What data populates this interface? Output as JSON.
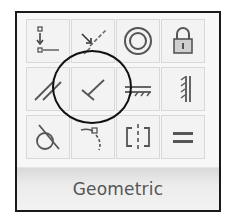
{
  "panel": {
    "title": "Geometric",
    "tools": [
      {
        "name": "coincident",
        "icon": "coincident-icon"
      },
      {
        "name": "collinear",
        "icon": "collinear-icon"
      },
      {
        "name": "concentric",
        "icon": "concentric-icon"
      },
      {
        "name": "fix",
        "icon": "lock-icon"
      },
      {
        "name": "parallel",
        "icon": "parallel-icon"
      },
      {
        "name": "perpendicular",
        "icon": "perpendicular-icon",
        "highlighted": true
      },
      {
        "name": "horizontal",
        "icon": "horizontal-icon"
      },
      {
        "name": "vertical",
        "icon": "vertical-icon"
      },
      {
        "name": "tangent",
        "icon": "tangent-icon"
      },
      {
        "name": "smooth",
        "icon": "smooth-icon"
      },
      {
        "name": "symmetric",
        "icon": "symmetric-icon"
      },
      {
        "name": "equal",
        "icon": "equal-icon"
      }
    ]
  },
  "annotation": {
    "shape": "circle",
    "target": "perpendicular",
    "color": "#111111"
  },
  "colors": {
    "border": "#1a1a1a",
    "cell_bg": "#f3f3f3",
    "icon": "#555555",
    "label": "#555555"
  }
}
